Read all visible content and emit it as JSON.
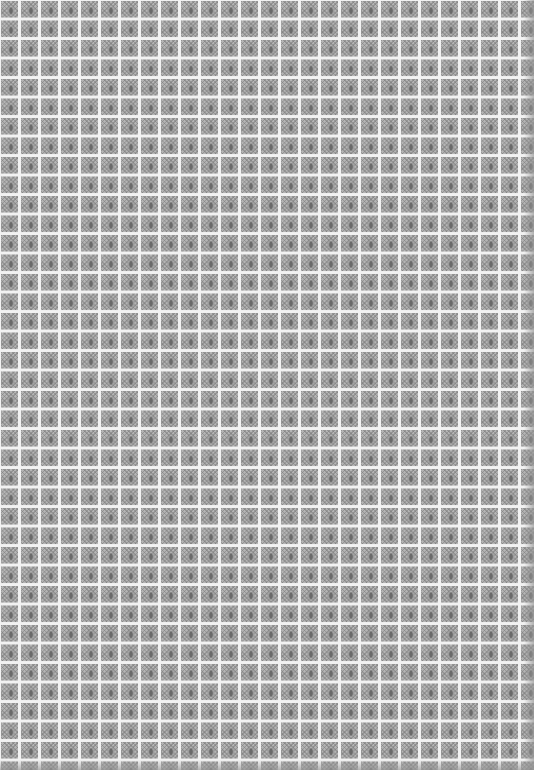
{
  "image": {
    "subject": "repeating decorative tile pattern",
    "grid": {
      "columns": 27,
      "rows": 39,
      "cell_width_px": 20,
      "cell_height_px": 19.5
    },
    "colors": {
      "grout_lines": "#f2f2f2",
      "tile_base": "#b5b5b5",
      "motif_dark": "#6a6a6a",
      "motif_mid": "#9a9a9a",
      "edge_shadow": "#969696"
    }
  }
}
